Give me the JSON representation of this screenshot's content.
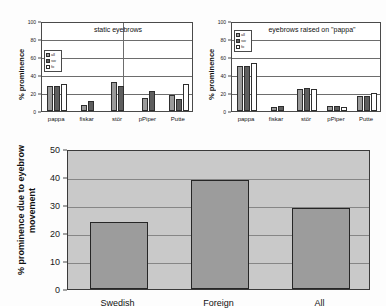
{
  "figure": {
    "background_color": "#fdfdfd",
    "series_colors": [
      "#9a9a9a",
      "#5e5e5e",
      "#ffffff"
    ]
  },
  "chart_data": [
    {
      "id": "static-eyebrows",
      "type": "bar",
      "title": "static eyebrows",
      "xlabel": "",
      "ylabel": "% prominence",
      "ylim": [
        0,
        100
      ],
      "yticks": [
        "0",
        "20",
        "40",
        "60",
        "80",
        "100"
      ],
      "grid": true,
      "legend_position": "upper-left-inside",
      "categories": [
        "pappa",
        "fiskar",
        "stör",
        "pPiper",
        "Putte"
      ],
      "series": [
        {
          "name": "all",
          "values": [
            28,
            7,
            32,
            15,
            18
          ]
        },
        {
          "name": "sw",
          "values": [
            28,
            11,
            28,
            22,
            13
          ]
        },
        {
          "name": "fo",
          "values": [
            30,
            null,
            null,
            null,
            30
          ]
        }
      ]
    },
    {
      "id": "eyebrows-raised",
      "type": "bar",
      "title": "eyebrows raised on \"pappa\"",
      "xlabel": "",
      "ylabel": "% prominence",
      "ylim": [
        0,
        100
      ],
      "yticks": [
        "0",
        "20",
        "40",
        "60",
        "80",
        "100"
      ],
      "grid": true,
      "legend_position": "upper-left-inside",
      "categories": [
        "pappa",
        "fiskar",
        "stör",
        "pPiper",
        "Putte"
      ],
      "series": [
        {
          "name": "all",
          "values": [
            50,
            4,
            25,
            6,
            17
          ]
        },
        {
          "name": "sw",
          "values": [
            50,
            6,
            26,
            6,
            17
          ]
        },
        {
          "name": "fo",
          "values": [
            53,
            null,
            24,
            5,
            20
          ]
        }
      ]
    },
    {
      "id": "eyebrow-movement",
      "type": "bar",
      "title": "",
      "xlabel": "",
      "ylabel": "% prominence due to eyebrow movement",
      "ylim": [
        0,
        50
      ],
      "yticks": [
        "0",
        "10",
        "20",
        "30",
        "40",
        "50"
      ],
      "grid": true,
      "categories": [
        "Swedish",
        "Foreign",
        "All"
      ],
      "values": [
        24,
        39,
        29
      ]
    }
  ],
  "legend": {
    "entries": [
      {
        "label": "all"
      },
      {
        "label": "sw"
      },
      {
        "label": "fo"
      }
    ]
  }
}
